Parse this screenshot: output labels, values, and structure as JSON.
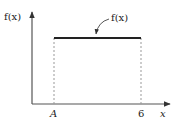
{
  "diagram": {
    "y_axis_label": "f(x)",
    "x_axis_label": "x",
    "curve_label": "f(x)",
    "tick_left": "A",
    "tick_right": "6",
    "colors": {
      "line": "#222222",
      "axis": "#555555",
      "dashed": "#999999"
    }
  }
}
